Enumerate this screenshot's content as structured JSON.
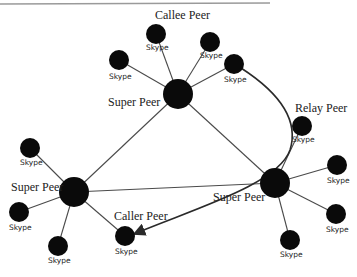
{
  "diagram": {
    "labels": {
      "callee": "Callee Peer",
      "relay": "Relay Peer",
      "caller": "Caller Peer",
      "super_center": "Super Peer",
      "super_left": "Super Peer",
      "super_right": "Super Peer"
    },
    "leaf_label": "Skype",
    "leaves": [
      {
        "id": "callee",
        "label": "Skype"
      },
      {
        "id": "center-leaf-2",
        "label": "Skype"
      },
      {
        "id": "center-leaf-3",
        "label": "Skype"
      },
      {
        "id": "center-leaf-left",
        "label": "Skype"
      },
      {
        "id": "relay",
        "label": "Skype"
      },
      {
        "id": "right-leaf-1",
        "label": "Skype"
      },
      {
        "id": "right-leaf-2",
        "label": "Skype"
      },
      {
        "id": "right-leaf-3",
        "label": "Skype"
      },
      {
        "id": "left-leaf-1",
        "label": "Skype"
      },
      {
        "id": "left-leaf-2",
        "label": "Skype"
      },
      {
        "id": "left-leaf-3",
        "label": "Skype"
      },
      {
        "id": "caller",
        "label": "Skype"
      }
    ]
  }
}
